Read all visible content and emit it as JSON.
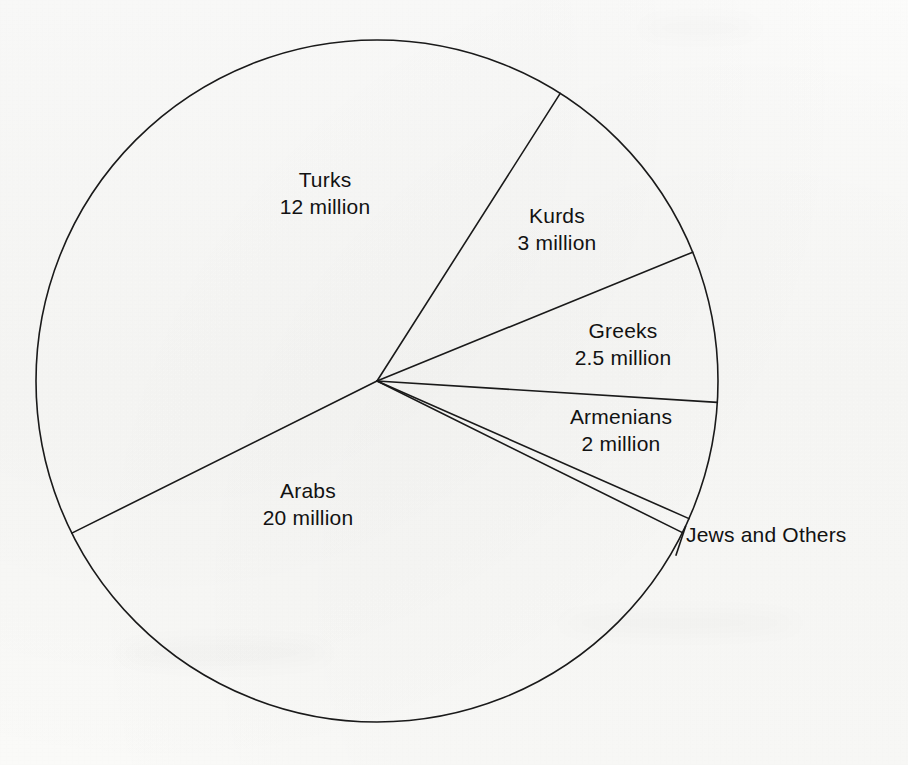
{
  "chart_data": {
    "type": "pie",
    "title": "",
    "subtitle": "",
    "unit": "million",
    "total": 39.75,
    "legend_position": "none",
    "grid": false,
    "categories": [
      "Arabs",
      "Turks",
      "Kurds",
      "Greeks",
      "Armenians",
      "Jews and Others"
    ],
    "values": [
      20,
      12,
      3,
      2.5,
      2,
      0.25
    ],
    "labels": [
      "Arabs\n20 million",
      "Turks\n12 million",
      "Kurds\n3 million",
      "Greeks\n2.5 million",
      "Armenians\n2 million",
      "Jews and Others"
    ],
    "slices": [
      {
        "id": "turks",
        "name": "Turks",
        "value_text": "12 million",
        "value": 12,
        "start_angle_deg": -57.5,
        "end_angle_deg": -206.5,
        "label_x": 325,
        "label_y": 193,
        "label_placement": "inside",
        "stroke": "#1a1a1a"
      },
      {
        "id": "kurds",
        "name": "Kurds",
        "value_text": "3 million",
        "value": 3,
        "start_angle_deg": -57.5,
        "end_angle_deg": -22.2,
        "label_x": 557,
        "label_y": 229,
        "label_placement": "inside",
        "stroke": "#1a1a1a"
      },
      {
        "id": "greeks",
        "name": "Greeks",
        "value_text": "2.5 million",
        "value": 2.5,
        "start_angle_deg": -22.2,
        "end_angle_deg": 3.6,
        "label_x": 623,
        "label_y": 344,
        "label_placement": "inside",
        "stroke": "#1a1a1a"
      },
      {
        "id": "armenians",
        "name": "Armenians",
        "value_text": "2 million",
        "value": 2,
        "start_angle_deg": 3.6,
        "end_angle_deg": 23.8,
        "label_x": 621,
        "label_y": 430,
        "label_placement": "inside",
        "stroke": "#1a1a1a"
      },
      {
        "id": "jews-and-others",
        "name": "Jews and Others",
        "value_text": "",
        "value": 0.25,
        "start_angle_deg": 23.8,
        "end_angle_deg": 26.4,
        "label_x": 686,
        "label_y": 534,
        "label_placement": "outside",
        "stroke": "#1a1a1a"
      },
      {
        "id": "arabs",
        "name": "Arabs",
        "value_text": "20 million",
        "value": 20,
        "start_angle_deg": 26.4,
        "end_angle_deg": 153.5,
        "label_x": 308,
        "label_y": 504,
        "label_placement": "inside",
        "stroke": "#1a1a1a"
      }
    ],
    "geometry": {
      "center_x": 377,
      "center_y": 381,
      "radius": 341,
      "line_color": "#1a1a1a",
      "line_width": 1.6,
      "fill": "none"
    }
  },
  "page": {
    "background_color": "#fbfbfa",
    "ink_color": "#121212",
    "width": 908,
    "height": 765
  }
}
